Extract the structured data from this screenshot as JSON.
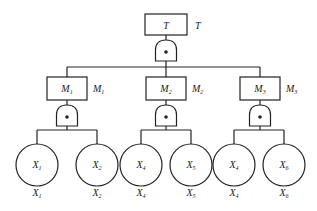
{
  "diagram": {
    "type": "fault-tree",
    "colors": {
      "stroke": "#222222",
      "background": "#ffffff",
      "text": "#1a1a1a"
    },
    "top_event": {
      "id": "T",
      "label": "T",
      "side_label": "T",
      "box": [
        145,
        14,
        42,
        21
      ],
      "gate": {
        "type": "AND",
        "cx": 166,
        "y": 40
      }
    },
    "intermediate_events": [
      {
        "id": "M1",
        "base": "M",
        "sub": "1",
        "side_base": "M",
        "side_sub": "1",
        "box": [
          47,
          77,
          40,
          23
        ],
        "gate": {
          "type": "AND",
          "cx": 67,
          "y": 105
        },
        "children": [
          "X1",
          "X2"
        ]
      },
      {
        "id": "M2",
        "base": "M",
        "sub": "2",
        "side_base": "M",
        "side_sub": "2",
        "box": [
          146,
          77,
          40,
          23
        ],
        "gate": {
          "type": "AND",
          "cx": 166,
          "y": 105
        },
        "children": [
          "X4",
          "X5"
        ]
      },
      {
        "id": "M3",
        "base": "M",
        "sub": "3",
        "side_base": "M",
        "side_sub": "3",
        "box": [
          240,
          77,
          40,
          23
        ],
        "gate": {
          "type": "AND",
          "cx": 260,
          "y": 105
        },
        "children": [
          "X4b",
          "X6"
        ]
      }
    ],
    "basic_events": [
      {
        "id": "X1",
        "base": "X",
        "sub": "1",
        "cx": 37,
        "cy": 165,
        "r": 21
      },
      {
        "id": "X2",
        "base": "X",
        "sub": "2",
        "cx": 97,
        "cy": 165,
        "r": 21
      },
      {
        "id": "X4",
        "base": "X",
        "sub": "4",
        "cx": 141,
        "cy": 165,
        "r": 21
      },
      {
        "id": "X5",
        "base": "X",
        "sub": "5",
        "cx": 191,
        "cy": 165,
        "r": 21
      },
      {
        "id": "X4b",
        "base": "X",
        "sub": "4",
        "cx": 234,
        "cy": 165,
        "r": 21
      },
      {
        "id": "X6",
        "base": "X",
        "sub": "6",
        "cx": 284,
        "cy": 165,
        "r": 21
      }
    ],
    "gate_symbol": "AND gate with dot"
  }
}
